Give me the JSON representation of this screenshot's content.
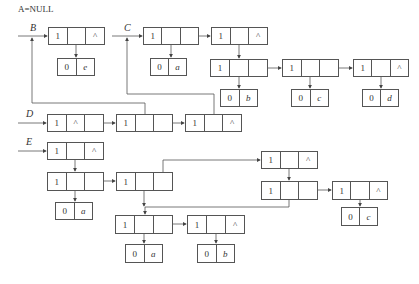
{
  "title": "A=NULL",
  "labels": {
    "B": "B",
    "C": "C",
    "D": "D",
    "E": "E"
  },
  "nodes": [
    {
      "id": "b1",
      "x": 48,
      "y": 27,
      "w": 57,
      "h": 18,
      "cells": [
        "1",
        "",
        "^"
      ]
    },
    {
      "id": "be",
      "x": 57,
      "y": 58,
      "w": 38,
      "h": 18,
      "cells": [
        "0",
        "e"
      ],
      "atom": true
    },
    {
      "id": "c1",
      "x": 143,
      "y": 27,
      "w": 56,
      "h": 18,
      "cells": [
        "1",
        "",
        ""
      ]
    },
    {
      "id": "ca",
      "x": 150,
      "y": 58,
      "w": 37,
      "h": 18,
      "cells": [
        "0",
        "a"
      ],
      "atom": true
    },
    {
      "id": "c2",
      "x": 211,
      "y": 27,
      "w": 57,
      "h": 18,
      "cells": [
        "1",
        "",
        "^"
      ]
    },
    {
      "id": "c3",
      "x": 210,
      "y": 59,
      "w": 58,
      "h": 18,
      "cells": [
        "1",
        "",
        ""
      ]
    },
    {
      "id": "c4",
      "x": 282,
      "y": 59,
      "w": 57,
      "h": 18,
      "cells": [
        "1",
        "",
        ""
      ]
    },
    {
      "id": "c5",
      "x": 353,
      "y": 59,
      "w": 56,
      "h": 18,
      "cells": [
        "1",
        "",
        "^"
      ]
    },
    {
      "id": "cb",
      "x": 220,
      "y": 89,
      "w": 38,
      "h": 18,
      "cells": [
        "0",
        "b"
      ],
      "atom": true
    },
    {
      "id": "cc",
      "x": 291,
      "y": 89,
      "w": 38,
      "h": 18,
      "cells": [
        "0",
        "c"
      ],
      "atom": true
    },
    {
      "id": "cd",
      "x": 362,
      "y": 89,
      "w": 37,
      "h": 18,
      "cells": [
        "0",
        "d"
      ],
      "atom": true
    },
    {
      "id": "d1",
      "x": 47,
      "y": 114,
      "w": 57,
      "h": 18,
      "cells": [
        "1",
        "^",
        ""
      ]
    },
    {
      "id": "d2",
      "x": 116,
      "y": 114,
      "w": 57,
      "h": 18,
      "cells": [
        "1",
        "",
        ""
      ]
    },
    {
      "id": "d3",
      "x": 185,
      "y": 114,
      "w": 57,
      "h": 18,
      "cells": [
        "1",
        "",
        "^"
      ]
    },
    {
      "id": "e1",
      "x": 47,
      "y": 142,
      "w": 57,
      "h": 18,
      "cells": [
        "1",
        "",
        "^"
      ]
    },
    {
      "id": "e2",
      "x": 47,
      "y": 172,
      "w": 57,
      "h": 19,
      "cells": [
        "1",
        "",
        ""
      ]
    },
    {
      "id": "e3",
      "x": 116,
      "y": 172,
      "w": 57,
      "h": 19,
      "cells": [
        "1",
        "",
        ""
      ]
    },
    {
      "id": "ea",
      "x": 55,
      "y": 202,
      "w": 38,
      "h": 18,
      "cells": [
        "0",
        "a"
      ],
      "atom": true
    },
    {
      "id": "e4",
      "x": 261,
      "y": 151,
      "w": 57,
      "h": 18,
      "cells": [
        "1",
        "",
        "^"
      ]
    },
    {
      "id": "e5",
      "x": 261,
      "y": 181,
      "w": 57,
      "h": 19,
      "cells": [
        "1",
        "",
        ""
      ]
    },
    {
      "id": "e6",
      "x": 332,
      "y": 181,
      "w": 56,
      "h": 19,
      "cells": [
        "1",
        "",
        "^"
      ]
    },
    {
      "id": "ec",
      "x": 341,
      "y": 207,
      "w": 37,
      "h": 19,
      "cells": [
        "0",
        "c"
      ],
      "atom": true
    },
    {
      "id": "e7",
      "x": 115,
      "y": 215,
      "w": 58,
      "h": 19,
      "cells": [
        "1",
        "",
        ""
      ]
    },
    {
      "id": "e8",
      "x": 187,
      "y": 215,
      "w": 58,
      "h": 19,
      "cells": [
        "1",
        "",
        "^"
      ]
    },
    {
      "id": "eaa",
      "x": 125,
      "y": 244,
      "w": 38,
      "h": 19,
      "cells": [
        "0",
        "a"
      ],
      "atom": true
    },
    {
      "id": "eb",
      "x": 197,
      "y": 244,
      "w": 38,
      "h": 19,
      "cells": [
        "0",
        "b"
      ],
      "atom": true
    }
  ]
}
